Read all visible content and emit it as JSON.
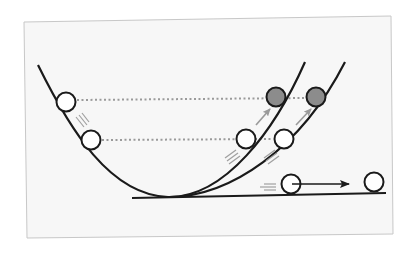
{
  "diagram": {
    "colors": {
      "panel_fill": "#f7f7f7",
      "panel_border": "#c8c8c8",
      "track": "#1a1a1a",
      "ball_fill_white": "#ffffff",
      "ball_fill_gray": "#8c8c8c",
      "ball_stroke": "#1a1a1a",
      "dotted_line": "#9a9a9a",
      "motion_lines": "#a0a0a0",
      "arrow_gray": "#9a9a9a",
      "arrow_black": "#1a1a1a"
    },
    "balls": [
      {
        "name": "ball-start-left",
        "fill": "white"
      },
      {
        "name": "ball-lower-left",
        "fill": "white"
      },
      {
        "name": "ball-lower-ramp1",
        "fill": "white"
      },
      {
        "name": "ball-lower-ramp2",
        "fill": "white"
      },
      {
        "name": "ball-top-ramp1",
        "fill": "gray"
      },
      {
        "name": "ball-top-ramp2",
        "fill": "gray"
      },
      {
        "name": "ball-flat-start",
        "fill": "white"
      },
      {
        "name": "ball-flat-end",
        "fill": "white"
      }
    ],
    "tracks": [
      "parabola-steep",
      "ramp-shallow",
      "ramp-flat"
    ],
    "reference_lines": [
      "release-height-line",
      "mid-height-line"
    ]
  }
}
